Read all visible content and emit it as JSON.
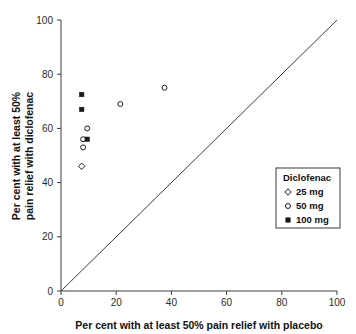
{
  "chart_data": {
    "type": "scatter",
    "title": "",
    "xlabel": "Per cent with at least 50% pain relief with placebo",
    "ylabel_line1": "Per cent with at least 50%",
    "ylabel_line2": "pain relief with diclofenac",
    "xlim": [
      0,
      100
    ],
    "ylim": [
      0,
      100
    ],
    "xticks": [
      0,
      20,
      40,
      60,
      80,
      100
    ],
    "yticks": [
      0,
      20,
      40,
      60,
      80,
      100
    ],
    "xticklabels": [
      "0",
      "20",
      "40",
      "60",
      "80",
      "100"
    ],
    "yticklabels": [
      "0",
      "20",
      "40",
      "60",
      "80",
      "100"
    ],
    "grid": false,
    "legend_position": "lower-right",
    "reference_line": {
      "name": "line-of-equality",
      "from": [
        0,
        0
      ],
      "to": [
        100,
        100
      ]
    },
    "series": [
      {
        "name": "25 mg",
        "marker": "open-diamond",
        "color": "#1a1a1a",
        "points": [
          {
            "x": 7.5,
            "y": 46.0
          }
        ]
      },
      {
        "name": "50 mg",
        "marker": "open-circle",
        "color": "#1a1a1a",
        "points": [
          {
            "x": 8.0,
            "y": 53.0
          },
          {
            "x": 8.0,
            "y": 56.0
          },
          {
            "x": 9.5,
            "y": 60.0
          },
          {
            "x": 21.5,
            "y": 69.0
          },
          {
            "x": 37.5,
            "y": 75.0
          }
        ]
      },
      {
        "name": "100 mg",
        "marker": "filled-square",
        "color": "#1a1a1a",
        "points": [
          {
            "x": 9.5,
            "y": 56.0
          },
          {
            "x": 7.5,
            "y": 67.0
          },
          {
            "x": 7.5,
            "y": 72.5
          }
        ]
      }
    ]
  },
  "legend": {
    "title": "Diclofenac",
    "entries": [
      {
        "label": "25 mg",
        "marker": "open-diamond"
      },
      {
        "label": "50 mg",
        "marker": "open-circle"
      },
      {
        "label": "100 mg",
        "marker": "filled-square"
      }
    ]
  },
  "colors": {
    "ink": "#1a1a1a",
    "axis": "#3a3a3a",
    "background": "#ffffff"
  }
}
